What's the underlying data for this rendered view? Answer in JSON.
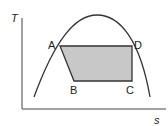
{
  "diagram": {
    "axes": {
      "y_label": "T",
      "x_label": "s"
    },
    "points": [
      {
        "name": "A",
        "x": 60,
        "y": 46
      },
      {
        "name": "B",
        "x": 74,
        "y": 81
      },
      {
        "name": "C",
        "x": 132,
        "y": 81
      },
      {
        "name": "D",
        "x": 132,
        "y": 46
      }
    ],
    "labels": {
      "A": "A",
      "B": "B",
      "C": "C",
      "D": "D"
    },
    "colors": {
      "line": "#333333",
      "fill": "#c8c8c8"
    }
  }
}
